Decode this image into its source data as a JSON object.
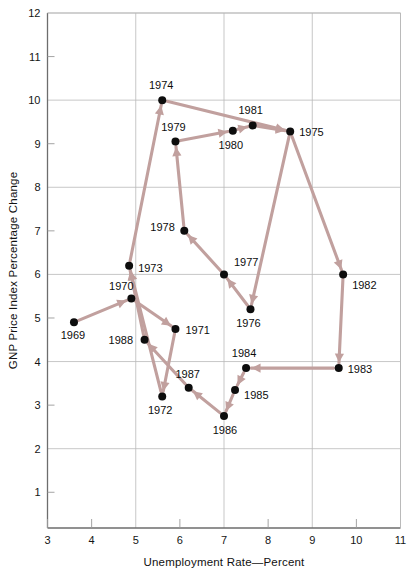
{
  "chart_data": {
    "type": "scatter",
    "title": "",
    "xlabel": "Unemployment Rate—Percent",
    "ylabel": "GNP Price Index Percentage Change",
    "xlim": [
      3,
      11
    ],
    "ylim": [
      0.18,
      12
    ],
    "xticks": [
      3,
      4,
      5,
      6,
      7,
      8,
      9,
      10,
      11
    ],
    "yticks": [
      1,
      2,
      3,
      4,
      5,
      6,
      7,
      8,
      9,
      10,
      11,
      12
    ],
    "gridlines": {
      "x": [
        5,
        7,
        9,
        11
      ],
      "y": [
        2,
        4,
        6,
        8,
        10,
        12
      ]
    },
    "grid": true,
    "legend": null,
    "connected": true,
    "connection_style": "arrow-path-chronological",
    "marker_color": "#0d0d0d",
    "line_color": "#c1a09e",
    "points": [
      {
        "label": "1969",
        "x": 3.6,
        "y": 4.9,
        "label_dx": -1,
        "label_dy": 17
      },
      {
        "label": "1970",
        "x": 4.9,
        "y": 5.45,
        "label_dx": -10,
        "label_dy": -8
      },
      {
        "label": "1971",
        "x": 5.9,
        "y": 4.75,
        "label_dx": 10,
        "label_dy": 5
      },
      {
        "label": "1972",
        "x": 5.6,
        "y": 3.2,
        "label_dx": -2,
        "label_dy": 18
      },
      {
        "label": "1973",
        "x": 4.85,
        "y": 6.2,
        "label_dx": 9,
        "label_dy": 6
      },
      {
        "label": "1974",
        "x": 5.6,
        "y": 10.0,
        "label_dx": -1,
        "label_dy": -11
      },
      {
        "label": "1975",
        "x": 8.5,
        "y": 9.28,
        "label_dx": 9,
        "label_dy": 4
      },
      {
        "label": "1976",
        "x": 7.6,
        "y": 5.2,
        "label_dx": -2,
        "label_dy": 18
      },
      {
        "label": "1977",
        "x": 7.0,
        "y": 6.0,
        "label_dx": 10,
        "label_dy": -8
      },
      {
        "label": "1978",
        "x": 6.1,
        "y": 7.0,
        "label_dx": -34,
        "label_dy": 0
      },
      {
        "label": "1979",
        "x": 5.9,
        "y": 9.05,
        "label_dx": -2,
        "label_dy": -11
      },
      {
        "label": "1980",
        "x": 7.2,
        "y": 9.3,
        "label_dx": -2,
        "label_dy": 18
      },
      {
        "label": "1981",
        "x": 7.65,
        "y": 9.42,
        "label_dx": -2,
        "label_dy": -11
      },
      {
        "label": "1982",
        "x": 9.7,
        "y": 6.0,
        "label_dx": 9,
        "label_dy": 15
      },
      {
        "label": "1983",
        "x": 9.6,
        "y": 3.85,
        "label_dx": 9,
        "label_dy": 5
      },
      {
        "label": "1984",
        "x": 7.5,
        "y": 3.85,
        "label_dx": -2,
        "label_dy": -11
      },
      {
        "label": "1985",
        "x": 7.25,
        "y": 3.35,
        "label_dx": 9,
        "label_dy": 9
      },
      {
        "label": "1986",
        "x": 7.0,
        "y": 2.75,
        "label_dx": 1,
        "label_dy": 18
      },
      {
        "label": "1987",
        "x": 6.2,
        "y": 3.4,
        "label_dx": -1,
        "label_dy": -10
      },
      {
        "label": "1988",
        "x": 5.2,
        "y": 4.5,
        "label_dx": -36,
        "label_dy": 4
      }
    ],
    "path_order": [
      "1969",
      "1970",
      "1971",
      "1972",
      "1973",
      "1974",
      "1975",
      "1976",
      "1977",
      "1978",
      "1979",
      "1980",
      "1981",
      "1975",
      "1982",
      "1983",
      "1984",
      "1985",
      "1986",
      "1987",
      "1988",
      "1973"
    ],
    "segments": [
      {
        "from": "1969",
        "to": "1970"
      },
      {
        "from": "1970",
        "to": "1971"
      },
      {
        "from": "1971",
        "to": "1972"
      },
      {
        "from": "1972",
        "to": "1973"
      },
      {
        "from": "1973",
        "to": "1974"
      },
      {
        "from": "1974",
        "to": "1975"
      },
      {
        "from": "1975",
        "to": "1976"
      },
      {
        "from": "1976",
        "to": "1977"
      },
      {
        "from": "1977",
        "to": "1978"
      },
      {
        "from": "1978",
        "to": "1979"
      },
      {
        "from": "1979",
        "to": "1980"
      },
      {
        "from": "1980",
        "to": "1981"
      },
      {
        "from": "1981",
        "to": "1975"
      },
      {
        "from": "1975",
        "to": "1982"
      },
      {
        "from": "1982",
        "to": "1983"
      },
      {
        "from": "1983",
        "to": "1984"
      },
      {
        "from": "1984",
        "to": "1985"
      },
      {
        "from": "1985",
        "to": "1986"
      },
      {
        "from": "1986",
        "to": "1987"
      },
      {
        "from": "1987",
        "to": "1988"
      },
      {
        "from": "1988",
        "to": "1973"
      }
    ]
  }
}
